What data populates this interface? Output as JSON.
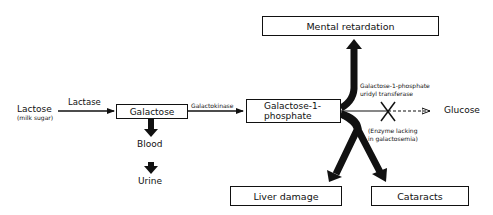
{
  "diagram": {
    "nodes": {
      "lactose": "Lactose",
      "lactose_note": "(milk sugar)",
      "galactose": "Galactose",
      "g1p_line1": "Galactose-1-",
      "g1p_line2": "phosphate",
      "blood": "Blood",
      "urine": "Urine",
      "glucose": "Glucose",
      "mental_retardation": "Mental retardation",
      "liver_damage": "Liver damage",
      "cataracts": "Cataracts"
    },
    "enzymes": {
      "lactase": "Lactase",
      "galactokinase": "Galactokinase",
      "transferase_line1": "Galactose-1-phosphate",
      "transferase_line2": "uridyl transferase",
      "lacking_line1": "(Enzyme lacking",
      "lacking_line2": "in galactosemia)"
    },
    "colors": {
      "stroke": "#111111",
      "background": "#ffffff"
    }
  }
}
